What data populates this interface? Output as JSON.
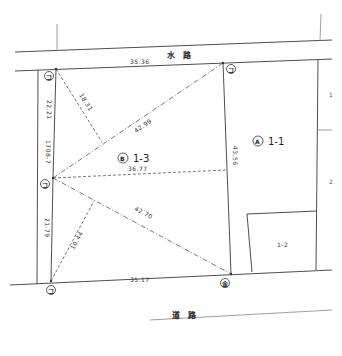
{
  "diagram": {
    "type": "land survey plat",
    "roads": {
      "waterway": "水　路",
      "road": "道　路"
    },
    "parcels": [
      {
        "mark": "A",
        "label": "1-1"
      },
      {
        "mark": "B",
        "label": "1-3"
      },
      {
        "mark": "",
        "label": "1-2"
      },
      {
        "mark": "",
        "label": "1708-7"
      }
    ],
    "dimensions": {
      "top_edge": "35.36",
      "bottom_edge": "35.17",
      "left_upper": "22.21",
      "left_lower": "21.79",
      "right_edge": "43.56",
      "diag_top_right": "42.99",
      "diag_bottom_right": "42.70",
      "horizontal_mid": "36.77",
      "perp_upper": "18.31",
      "perp_lower": "10.44"
    },
    "point_marks": {
      "top_left": "コ",
      "top_right": "コ",
      "left_mid": "コ",
      "bottom_left": "コ",
      "bottom_right": "金"
    },
    "side_labels": {
      "right_1": "1",
      "right_2": "2"
    },
    "colors": {
      "line": "#3a3a3a",
      "background": "#ffffff"
    }
  }
}
